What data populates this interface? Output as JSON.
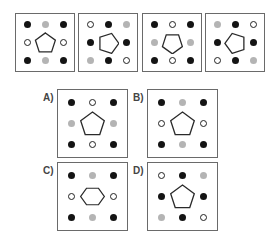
{
  "puzzle": {
    "sequence": [
      {
        "id": "seq-1",
        "shape": "pentagon",
        "rotation": 0,
        "dots": [
          [
            "black",
            "gray",
            "black"
          ],
          [
            "white",
            null,
            "white"
          ],
          [
            "black",
            "gray",
            "black"
          ]
        ]
      },
      {
        "id": "seq-2",
        "shape": "pentagon",
        "rotation": 90,
        "dots": [
          [
            "white",
            "black",
            "gray"
          ],
          [
            "black",
            null,
            "black"
          ],
          [
            "gray",
            "black",
            "white"
          ]
        ]
      },
      {
        "id": "seq-3",
        "shape": "pentagon",
        "rotation": 180,
        "dots": [
          [
            "black",
            "white",
            "black"
          ],
          [
            "gray",
            null,
            "gray"
          ],
          [
            "black",
            "white",
            "black"
          ]
        ]
      },
      {
        "id": "seq-4",
        "shape": "pentagon",
        "rotation": 270,
        "dots": [
          [
            "gray",
            "black",
            "white"
          ],
          [
            "black",
            null,
            "black"
          ],
          [
            "white",
            "black",
            "gray"
          ]
        ]
      }
    ],
    "options": [
      {
        "label": "A)",
        "shape": "pentagon",
        "rotation": 0,
        "dots": [
          [
            "black",
            "white",
            "black"
          ],
          [
            "gray",
            null,
            "gray"
          ],
          [
            "black",
            "white",
            "black"
          ]
        ]
      },
      {
        "label": "B)",
        "shape": "pentagon",
        "rotation": 0,
        "dots": [
          [
            "black",
            "gray",
            "black"
          ],
          [
            "white",
            null,
            "white"
          ],
          [
            "black",
            "gray",
            "black"
          ]
        ]
      },
      {
        "label": "C)",
        "shape": "hexagon",
        "rotation": 0,
        "dots": [
          [
            "black",
            "gray",
            "black"
          ],
          [
            "white",
            null,
            "white"
          ],
          [
            "black",
            "gray",
            "black"
          ]
        ]
      },
      {
        "label": "D)",
        "shape": "pentagon",
        "rotation": 0,
        "dots": [
          [
            "white",
            "black",
            "gray"
          ],
          [
            "black",
            null,
            "black"
          ],
          [
            "gray",
            "black",
            "white"
          ]
        ]
      }
    ]
  },
  "colors": {
    "black": "#141414",
    "gray": "#b4b4b4",
    "white": "#ffffff",
    "border": "#6a6a6a"
  }
}
